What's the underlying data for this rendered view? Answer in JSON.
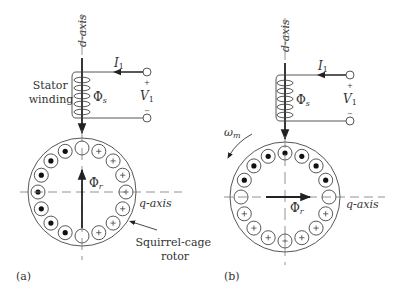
{
  "colors": {
    "line": "#555555",
    "heavy": "#222222",
    "text": "#333333",
    "dot": "#111111"
  },
  "panels": [
    {
      "id": "a",
      "caption": "(a)",
      "d_axis_label": "d-axis",
      "q_axis_label": "q-axis",
      "current_label": "I",
      "current_sub": "1",
      "voltage_label": "V",
      "voltage_sub": "1",
      "plus_sign": "+",
      "minus_sign": "−",
      "stator_flux_label": "Φ",
      "stator_flux_sub": "s",
      "rotor_flux_label": "Φ",
      "rotor_flux_sub": "r",
      "stator_winding_label": [
        "Stator",
        "winding"
      ],
      "rotor_label": [
        "Squirrel-cage",
        "rotor"
      ],
      "rotor_flux_direction": "up",
      "conductors": [
        "empty",
        "plus",
        "plus",
        "plus",
        "plus",
        "plus",
        "plus",
        "plus",
        "empty",
        "dot",
        "dot",
        "dot",
        "dot",
        "dot",
        "dot",
        "dot"
      ]
    },
    {
      "id": "b",
      "caption": "(b)",
      "d_axis_label": "d-axis",
      "q_axis_label": "q-axis",
      "current_label": "I",
      "current_sub": "1",
      "voltage_label": "V",
      "voltage_sub": "1",
      "plus_sign": "+",
      "minus_sign": "−",
      "stator_flux_label": "Φ",
      "stator_flux_sub": "s",
      "rotor_flux_label": "Φ",
      "rotor_flux_sub": "r",
      "speed_label": "ω",
      "speed_sub": "m",
      "rotor_flux_direction": "right",
      "conductors": [
        "dot",
        "dot",
        "dot",
        "dot",
        "empty",
        "plus",
        "plus",
        "plus",
        "plus",
        "plus",
        "plus",
        "plus",
        "empty",
        "dot",
        "dot",
        "dot"
      ]
    }
  ]
}
